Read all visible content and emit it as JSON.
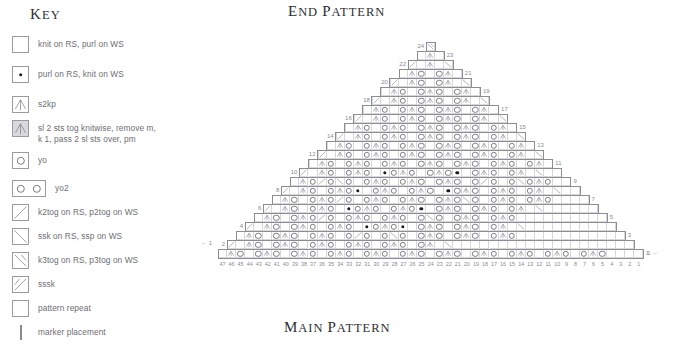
{
  "titles": {
    "end_pattern": {
      "first": "E",
      "rest": "ND",
      "space": " ",
      "w1": "P",
      "w2": "ATTERN"
    },
    "end_pattern_text": "End pattern",
    "main_pattern_text": "Main pattern",
    "key_text": "Key"
  },
  "key": {
    "title": "Key",
    "items": [
      {
        "symbol": "empty-square",
        "label": "knit on RS, purl on WS"
      },
      {
        "symbol": "purl-dot-square",
        "label": "purl on RS, knit on WS"
      },
      {
        "symbol": "s2kp-square",
        "label": "s2kp"
      },
      {
        "symbol": "s2kp-shaded-square",
        "label": "sl 2 sts tog knitwise, remove m,\nk 1, pass 2 sl sts over, pm"
      },
      {
        "symbol": "yo-square",
        "label": "yo"
      },
      {
        "symbol": "yo2-double-square",
        "label": "yo2"
      },
      {
        "symbol": "k2tog-square",
        "label": "k2tog on RS, p2tog on WS"
      },
      {
        "symbol": "ssk-square",
        "label": "ssk on RS, ssp on WS"
      },
      {
        "symbol": "k3tog-square",
        "label": "k3tog on RS, p3tog on WS"
      },
      {
        "symbol": "sssk-square",
        "label": "sssk"
      },
      {
        "symbol": "pattern-repeat-square",
        "label": "pattern repeat"
      },
      {
        "symbol": "marker-line",
        "label": "marker placement"
      }
    ]
  },
  "chart": {
    "type": "knitting-chart",
    "shape": "triangle",
    "rows_total": 24,
    "base_columns": 47,
    "center_column": 24,
    "cell_px": 9.0,
    "left_row_labels": [
      "2",
      "4",
      "6",
      "8",
      "10",
      "12",
      "14",
      "16",
      "18",
      "20",
      "22",
      "24"
    ],
    "right_row_labels": [
      "1",
      "3",
      "5",
      "7",
      "9",
      "11",
      "13",
      "15",
      "17",
      "19",
      "21",
      "23"
    ],
    "column_labels": [
      "47",
      "46",
      "45",
      "44",
      "43",
      "42",
      "41",
      "40",
      "39",
      "38",
      "37",
      "36",
      "35",
      "34",
      "33",
      "32",
      "31",
      "30",
      "29",
      "28",
      "27",
      "26",
      "25",
      "24",
      "23",
      "22",
      "21",
      "20",
      "19",
      "18",
      "17",
      "16",
      "15",
      "14",
      "13",
      "12",
      "11",
      "10",
      "9",
      "8",
      "7",
      "6",
      "5",
      "4",
      "3",
      "2",
      "1"
    ],
    "start_arrow_label": "1",
    "end_arrow_label": "1",
    "colors": {
      "grid": "#d8d8dc",
      "outline": "#8d8d93",
      "symbol": "#7d7d84",
      "purl": "#1b1b1f",
      "text": "#8a8a90"
    },
    "rows": [
      {
        "row": 24,
        "width": 1,
        "symbols": [
          "k3"
        ]
      },
      {
        "row": 23,
        "width": 3,
        "symbols": [
          "",
          "s2kp",
          ""
        ]
      },
      {
        "row": 22,
        "width": 5,
        "symbols": [
          "k2tog",
          "",
          "s2kp",
          "",
          "ssk"
        ]
      },
      {
        "row": 21,
        "width": 7,
        "symbols": [
          "",
          "s2kp",
          "yo",
          "",
          "yo",
          "s2kp",
          ""
        ]
      },
      {
        "row": 20,
        "width": 9,
        "symbols": [
          "k2tog",
          "",
          "s2kp",
          "yo",
          "",
          "yo",
          "s2kp",
          "",
          "ssk"
        ]
      },
      {
        "row": 19,
        "width": 11,
        "symbols": [
          "",
          "s2kp",
          "yo",
          "",
          "yo",
          "s2kp",
          "yo",
          "",
          "yo",
          "s2kp",
          ""
        ]
      },
      {
        "row": 18,
        "width": 13,
        "symbols": [
          "k2tog",
          "",
          "s2kp",
          "yo",
          "",
          "yo",
          "s2kp",
          "yo",
          "",
          "yo",
          "s2kp",
          "",
          "ssk"
        ]
      },
      {
        "row": 17,
        "width": 15,
        "symbols": [
          "",
          "s2kp",
          "yo",
          "",
          "yo",
          "s2kp",
          "yo",
          "",
          "yo",
          "s2kp",
          "yo",
          "",
          "yo",
          "s2kp",
          ""
        ]
      },
      {
        "row": 16,
        "width": 17,
        "symbols": [
          "k2tog",
          "",
          "s2kp",
          "yo",
          "",
          "yo",
          "s2kp",
          "yo",
          "",
          "yo",
          "s2kp",
          "yo",
          "",
          "yo",
          "s2kp",
          "",
          "ssk"
        ]
      },
      {
        "row": 15,
        "width": 19,
        "symbols": [
          "",
          "s2kp",
          "yo",
          "",
          "yo",
          "s2kp",
          "yo",
          "",
          "yo",
          "s2kp",
          "yo",
          "",
          "yo",
          "s2kp",
          "yo",
          "",
          "yo",
          "s2kp",
          ""
        ]
      },
      {
        "row": 14,
        "width": 21,
        "symbols": [
          "k2tog",
          "",
          "s2kp",
          "yo",
          "",
          "yo",
          "s2kp",
          "yo",
          "",
          "yo",
          "s2kp",
          "yo",
          "",
          "yo",
          "s2kp",
          "yo",
          "",
          "yo",
          "s2kp",
          "",
          "ssk"
        ]
      },
      {
        "row": 13,
        "width": 23,
        "symbols": [
          "",
          "s2kp",
          "yo",
          "",
          "yo",
          "s2kp",
          "yo",
          "",
          "yo",
          "s2kp",
          "yo",
          "",
          "yo",
          "s2kp",
          "yo",
          "",
          "yo",
          "s2kp",
          "yo",
          "",
          "yo",
          "s2kp",
          ""
        ]
      },
      {
        "row": 12,
        "width": 25,
        "symbols": [
          "k2tog",
          "",
          "s2kp",
          "yo",
          "",
          "yo",
          "s2kp",
          "yo",
          "",
          "yo",
          "s2kp",
          "yo",
          "",
          "yo",
          "s2kp",
          "yo",
          "",
          "yo",
          "s2kp",
          "yo",
          "",
          "yo",
          "s2kp",
          "",
          "ssk"
        ]
      },
      {
        "row": 11,
        "width": 27,
        "symbols": [
          "",
          "s2kp",
          "yo",
          "",
          "yo",
          "s2kp",
          "yo",
          "",
          "yo",
          "s2kp",
          "yo",
          "",
          "yo",
          "s2kp",
          "yo",
          "",
          "yo",
          "s2kp",
          "yo",
          "",
          "yo",
          "s2kp",
          "yo",
          "",
          "yo",
          "s2kp",
          ""
        ]
      },
      {
        "row": 10,
        "width": 29,
        "symbols": [
          "k2tog",
          "",
          "s2kp",
          "yo",
          "",
          "yo",
          "s2kp",
          "yo",
          "",
          "purl",
          "yo",
          "s2kp",
          "yo",
          "",
          "yo",
          "s2kp",
          "yo",
          "purl",
          "",
          "yo",
          "s2kp",
          "yo",
          "",
          "yo",
          "s2kp",
          "",
          "ssk",
          "",
          ""
        ]
      },
      {
        "row": 9,
        "width": 31,
        "symbols": [
          "",
          "s2kp",
          "yo",
          "k2tog",
          "yo",
          "ssk",
          "yo",
          "",
          "yo",
          "s2kp",
          "yo",
          "",
          "yo",
          "s2kp",
          "yo",
          "",
          "yo",
          "s2kp",
          "yo",
          "",
          "yo",
          "k2tog",
          "yo",
          "",
          "yo",
          "ssk",
          "yo",
          "s2kp",
          "yo",
          "",
          ""
        ]
      },
      {
        "row": 8,
        "width": 33,
        "symbols": [
          "k2tog",
          "",
          "s2kp",
          "yo",
          "",
          "yo",
          "s2kp",
          "yo",
          "purl",
          "",
          "yo",
          "s2kp",
          "yo",
          "",
          "yo",
          "s2kp",
          "yo",
          "",
          "purl",
          "yo",
          "s2kp",
          "yo",
          "",
          "yo",
          "s2kp",
          "yo",
          "",
          "yo",
          "s2kp",
          "",
          "ssk",
          "",
          ""
        ]
      },
      {
        "row": 7,
        "width": 35,
        "symbols": [
          "",
          "s2kp",
          "yo",
          "",
          "yo",
          "s2kp",
          "yo",
          "k2tog",
          "yo",
          "",
          "yo",
          "s2kp",
          "yo",
          "",
          "yo",
          "s2kp",
          "yo",
          "",
          "yo",
          "s2kp",
          "yo",
          "ssk",
          "yo",
          "",
          "yo",
          "s2kp",
          "yo",
          "",
          "yo",
          "s2kp",
          "yo",
          "",
          "",
          "",
          ""
        ]
      },
      {
        "row": 6,
        "width": 37,
        "symbols": [
          "k2tog",
          "",
          "s2kp",
          "yo",
          "",
          "yo",
          "s2kp",
          "yo",
          "",
          "purl",
          "yo",
          "s2kp",
          "yo",
          "",
          "yo",
          "s2kp",
          "yo",
          "purl",
          "",
          "yo",
          "s2kp",
          "yo",
          "",
          "yo",
          "s2kp",
          "yo",
          "",
          "yo",
          "s2kp",
          "",
          "ssk",
          "",
          "",
          "",
          "",
          "",
          ""
        ]
      },
      {
        "row": 5,
        "width": 39,
        "symbols": [
          "",
          "s2kp",
          "yo",
          "",
          "yo",
          "s2kp",
          "yo",
          "k2tog",
          "yo",
          "",
          "yo",
          "s2kp",
          "yo",
          "",
          "yo",
          "s2kp",
          "yo",
          "",
          "yo",
          "ssk",
          "yo",
          "",
          "yo",
          "s2kp",
          "yo",
          "",
          "yo",
          "s2kp",
          "yo",
          "",
          "",
          "",
          "",
          "",
          "",
          "",
          "",
          "",
          ""
        ]
      },
      {
        "row": 4,
        "width": 41,
        "symbols": [
          "k2tog",
          "",
          "s2kp",
          "yo",
          "",
          "yo",
          "s2kp",
          "yo",
          "",
          "yo",
          "s2kp",
          "yo",
          "",
          "purl",
          "yo",
          "s2kp",
          "yo",
          "purl",
          "",
          "yo",
          "s2kp",
          "yo",
          "",
          "yo",
          "s2kp",
          "yo",
          "",
          "yo",
          "s2kp",
          "",
          "ssk",
          "",
          "",
          "",
          "",
          "",
          "",
          "",
          "",
          "",
          ""
        ]
      },
      {
        "row": 3,
        "width": 43,
        "symbols": [
          "",
          "s2kp",
          "yo",
          "",
          "yo",
          "s2kp",
          "yo",
          "",
          "yo",
          "s2kp",
          "yo",
          "",
          "yo",
          "k2tog",
          "yo",
          "",
          "yo",
          "ssk",
          "yo",
          "",
          "yo",
          "s2kp",
          "yo",
          "",
          "yo",
          "s2kp",
          "yo",
          "",
          "yo",
          "s2kp",
          "yo",
          "",
          "",
          "",
          "",
          "",
          "",
          "",
          "",
          "",
          "",
          "",
          ""
        ]
      },
      {
        "row": 2,
        "width": 45,
        "symbols": [
          "k2tog",
          "",
          "s2kp",
          "yo",
          "",
          "yo",
          "s2kp",
          "yo",
          "",
          "yo",
          "s2kp",
          "yo",
          "",
          "yo",
          "s2kp",
          "yo",
          "",
          "yo",
          "s2kp",
          "yo",
          "",
          "yo",
          "s2kp",
          "",
          "ssk",
          "",
          "",
          "",
          "",
          "",
          "",
          "",
          "",
          "",
          "",
          "",
          "",
          "",
          "",
          "",
          "",
          "",
          "",
          "",
          ""
        ]
      },
      {
        "row": 1,
        "width": 47,
        "symbols": [
          "",
          "s2kp",
          "yo",
          "",
          "yo",
          "s2kp",
          "yo",
          "",
          "yo",
          "s2kp",
          "yo",
          "",
          "yo",
          "s2kp",
          "yo",
          "",
          "yo",
          "s2kp",
          "yo",
          "",
          "yo",
          "s2kp",
          "yo",
          "",
          "yo",
          "s2kp",
          "yo",
          "",
          "yo",
          "s2kp",
          "yo",
          "",
          "yo",
          "s2kp",
          "yo",
          "",
          "yo",
          "s2kp",
          "yo",
          "",
          "yo",
          "s2kp",
          "yo",
          "",
          "",
          "",
          ""
        ]
      }
    ]
  }
}
